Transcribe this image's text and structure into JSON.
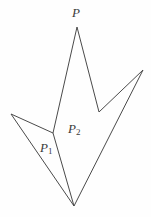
{
  "figure": {
    "background_color": "#fefefe",
    "stroke_color": "#4a4a4a",
    "stroke_width": 1,
    "width": 151,
    "height": 217,
    "labels": {
      "apex": "P",
      "left_region": "P",
      "left_region_sub": "1",
      "main_region": "P",
      "main_region_sub": "2"
    },
    "vertices": {
      "top_apex": [
        77,
        27
      ],
      "right_valley": [
        99,
        112
      ],
      "right_tip": [
        143,
        70
      ],
      "bottom": [
        74,
        206
      ],
      "left_tip": [
        11,
        114
      ],
      "junction": [
        53,
        133
      ]
    },
    "outline_path": "M 77,27 L 99,112 L 143,70 L 74,206 L 11,114 L 53,133 Z",
    "chord_path": "M 53,133 L 74,206"
  }
}
